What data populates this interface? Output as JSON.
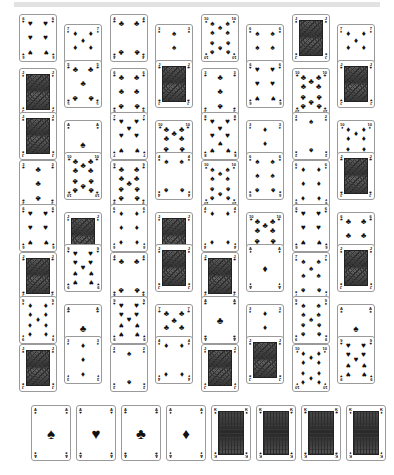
{
  "page": {
    "background_color": "#ffffff",
    "top_bar_color": "#e2e2e2",
    "card_border_color": "#9a9a9a",
    "pip_color": "#111111",
    "width": 394,
    "height": 475
  },
  "suit_glyphs": {
    "spades": "♠",
    "hearts": "♥",
    "clubs": "♣",
    "diamonds": "♦"
  },
  "deck": {
    "layout": "staggered-grid",
    "columns": 8,
    "rows": 8,
    "card_width": 38,
    "card_height": 48,
    "cards": [
      {
        "rank": "6",
        "suit": "hearts",
        "kind": "pip",
        "x": 19,
        "y": 14,
        "col": 0,
        "row": 0
      },
      {
        "rank": "7",
        "suit": "diamonds",
        "kind": "pip",
        "x": 64,
        "y": 24,
        "col": 1,
        "row": 0
      },
      {
        "rank": "4",
        "suit": "clubs",
        "kind": "pip",
        "x": 110,
        "y": 14,
        "col": 2,
        "row": 0
      },
      {
        "rank": "3",
        "suit": "spades",
        "kind": "pip",
        "x": 155,
        "y": 24,
        "col": 3,
        "row": 0
      },
      {
        "rank": "10",
        "suit": "spades",
        "kind": "pip",
        "x": 201,
        "y": 14,
        "col": 4,
        "row": 0
      },
      {
        "rank": "6",
        "suit": "spades",
        "kind": "pip",
        "x": 246,
        "y": 24,
        "col": 5,
        "row": 0
      },
      {
        "rank": "J",
        "suit": "spades",
        "kind": "face",
        "x": 292,
        "y": 14,
        "col": 6,
        "row": 0
      },
      {
        "rank": "7",
        "suit": "diamonds",
        "kind": "pip",
        "x": 337,
        "y": 24,
        "col": 7,
        "row": 0
      },
      {
        "rank": "J",
        "suit": "diamonds",
        "kind": "face",
        "x": 19,
        "y": 68,
        "col": 0,
        "row": 1
      },
      {
        "rank": "5",
        "suit": "clubs",
        "kind": "pip",
        "x": 64,
        "y": 60,
        "col": 1,
        "row": 1
      },
      {
        "rank": "6",
        "suit": "clubs",
        "kind": "pip",
        "x": 110,
        "y": 68,
        "col": 2,
        "row": 1
      },
      {
        "rank": "J",
        "suit": "clubs",
        "kind": "face",
        "x": 155,
        "y": 60,
        "col": 3,
        "row": 1
      },
      {
        "rank": "3",
        "suit": "clubs",
        "kind": "pip",
        "x": 201,
        "y": 68,
        "col": 4,
        "row": 1
      },
      {
        "rank": "6",
        "suit": "hearts",
        "kind": "pip",
        "x": 246,
        "y": 60,
        "col": 5,
        "row": 1
      },
      {
        "rank": "10",
        "suit": "clubs",
        "kind": "pip",
        "x": 292,
        "y": 68,
        "col": 6,
        "row": 1
      },
      {
        "rank": "J",
        "suit": "hearts",
        "kind": "face",
        "x": 337,
        "y": 60,
        "col": 7,
        "row": 1
      },
      {
        "rank": "J",
        "suit": "spades",
        "kind": "face",
        "x": 19,
        "y": 112,
        "col": 0,
        "row": 2
      },
      {
        "rank": "A",
        "suit": "spades",
        "kind": "ace",
        "x": 64,
        "y": 120,
        "col": 1,
        "row": 2
      },
      {
        "rank": "7",
        "suit": "hearts",
        "kind": "pip",
        "x": 110,
        "y": 112,
        "col": 2,
        "row": 2
      },
      {
        "rank": "10",
        "suit": "clubs",
        "kind": "pip",
        "x": 155,
        "y": 120,
        "col": 3,
        "row": 2
      },
      {
        "rank": "8",
        "suit": "hearts",
        "kind": "pip",
        "x": 201,
        "y": 112,
        "col": 4,
        "row": 2
      },
      {
        "rank": "3",
        "suit": "diamonds",
        "kind": "pip",
        "x": 246,
        "y": 120,
        "col": 5,
        "row": 2
      },
      {
        "rank": "2",
        "suit": "spades",
        "kind": "pip",
        "x": 292,
        "y": 112,
        "col": 6,
        "row": 2
      },
      {
        "rank": "10",
        "suit": "diamonds",
        "kind": "pip",
        "x": 337,
        "y": 120,
        "col": 7,
        "row": 2
      },
      {
        "rank": "3",
        "suit": "clubs",
        "kind": "pip",
        "x": 19,
        "y": 160,
        "col": 0,
        "row": 3
      },
      {
        "rank": "10",
        "suit": "clubs",
        "kind": "pip",
        "x": 64,
        "y": 152,
        "col": 1,
        "row": 3
      },
      {
        "rank": "9",
        "suit": "clubs",
        "kind": "pip",
        "x": 110,
        "y": 160,
        "col": 2,
        "row": 3
      },
      {
        "rank": "4",
        "suit": "spades",
        "kind": "pip",
        "x": 155,
        "y": 152,
        "col": 3,
        "row": 3
      },
      {
        "rank": "10",
        "suit": "spades",
        "kind": "pip",
        "x": 201,
        "y": 160,
        "col": 4,
        "row": 3
      },
      {
        "rank": "6",
        "suit": "spades",
        "kind": "pip",
        "x": 246,
        "y": 152,
        "col": 5,
        "row": 3
      },
      {
        "rank": "6",
        "suit": "diamonds",
        "kind": "pip",
        "x": 292,
        "y": 160,
        "col": 6,
        "row": 3
      },
      {
        "rank": "J",
        "suit": "clubs",
        "kind": "face",
        "x": 337,
        "y": 152,
        "col": 7,
        "row": 3
      },
      {
        "rank": "6",
        "suit": "hearts",
        "kind": "pip",
        "x": 19,
        "y": 204,
        "col": 0,
        "row": 4
      },
      {
        "rank": "J",
        "suit": "diamonds",
        "kind": "face",
        "x": 64,
        "y": 212,
        "col": 1,
        "row": 4
      },
      {
        "rank": "6",
        "suit": "diamonds",
        "kind": "pip",
        "x": 110,
        "y": 204,
        "col": 2,
        "row": 4
      },
      {
        "rank": "J",
        "suit": "diamonds",
        "kind": "face",
        "x": 155,
        "y": 212,
        "col": 3,
        "row": 4
      },
      {
        "rank": "4",
        "suit": "diamonds",
        "kind": "pip",
        "x": 201,
        "y": 204,
        "col": 4,
        "row": 4
      },
      {
        "rank": "10",
        "suit": "clubs",
        "kind": "pip",
        "x": 246,
        "y": 212,
        "col": 5,
        "row": 4
      },
      {
        "rank": "6",
        "suit": "hearts",
        "kind": "pip",
        "x": 292,
        "y": 204,
        "col": 6,
        "row": 4
      },
      {
        "rank": "6",
        "suit": "clubs",
        "kind": "pip",
        "x": 337,
        "y": 212,
        "col": 7,
        "row": 4
      },
      {
        "rank": "J",
        "suit": "clubs",
        "kind": "face",
        "x": 19,
        "y": 252,
        "col": 0,
        "row": 5
      },
      {
        "rank": "9",
        "suit": "hearts",
        "kind": "pip",
        "x": 64,
        "y": 244,
        "col": 1,
        "row": 5
      },
      {
        "rank": "4",
        "suit": "clubs",
        "kind": "pip",
        "x": 110,
        "y": 252,
        "col": 2,
        "row": 5
      },
      {
        "rank": "J",
        "suit": "spades",
        "kind": "face",
        "x": 155,
        "y": 244,
        "col": 3,
        "row": 5
      },
      {
        "rank": "J",
        "suit": "clubs",
        "kind": "face",
        "x": 201,
        "y": 252,
        "col": 4,
        "row": 5
      },
      {
        "rank": "A",
        "suit": "diamonds",
        "kind": "ace",
        "x": 246,
        "y": 244,
        "col": 5,
        "row": 5
      },
      {
        "rank": "7",
        "suit": "spades",
        "kind": "pip",
        "x": 292,
        "y": 252,
        "col": 6,
        "row": 5
      },
      {
        "rank": "J",
        "suit": "spades",
        "kind": "face",
        "x": 337,
        "y": 244,
        "col": 7,
        "row": 5
      },
      {
        "rank": "9",
        "suit": "diamonds",
        "kind": "pip",
        "x": 19,
        "y": 296,
        "col": 0,
        "row": 6
      },
      {
        "rank": "A",
        "suit": "clubs",
        "kind": "ace",
        "x": 64,
        "y": 304,
        "col": 1,
        "row": 6
      },
      {
        "rank": "9",
        "suit": "hearts",
        "kind": "pip",
        "x": 110,
        "y": 296,
        "col": 2,
        "row": 6
      },
      {
        "rank": "7",
        "suit": "clubs",
        "kind": "pip",
        "x": 155,
        "y": 304,
        "col": 3,
        "row": 6
      },
      {
        "rank": "A",
        "suit": "clubs",
        "kind": "ace",
        "x": 201,
        "y": 296,
        "col": 4,
        "row": 6
      },
      {
        "rank": "3",
        "suit": "diamonds",
        "kind": "pip",
        "x": 246,
        "y": 304,
        "col": 5,
        "row": 6
      },
      {
        "rank": "9",
        "suit": "spades",
        "kind": "pip",
        "x": 292,
        "y": 296,
        "col": 6,
        "row": 6
      },
      {
        "rank": "A",
        "suit": "spades",
        "kind": "ace",
        "x": 337,
        "y": 304,
        "col": 7,
        "row": 6
      },
      {
        "rank": "J",
        "suit": "spades",
        "kind": "face",
        "x": 19,
        "y": 344,
        "col": 0,
        "row": 7
      },
      {
        "rank": "3",
        "suit": "diamonds",
        "kind": "pip",
        "x": 64,
        "y": 336,
        "col": 1,
        "row": 7
      },
      {
        "rank": "2",
        "suit": "spades",
        "kind": "pip",
        "x": 110,
        "y": 344,
        "col": 2,
        "row": 7
      },
      {
        "rank": "4",
        "suit": "diamonds",
        "kind": "pip",
        "x": 155,
        "y": 336,
        "col": 3,
        "row": 7
      },
      {
        "rank": "J",
        "suit": "diamonds",
        "kind": "face",
        "x": 201,
        "y": 344,
        "col": 4,
        "row": 7
      },
      {
        "rank": "J",
        "suit": "spades",
        "kind": "face",
        "x": 246,
        "y": 336,
        "col": 5,
        "row": 7
      },
      {
        "rank": "10",
        "suit": "diamonds",
        "kind": "pip",
        "x": 292,
        "y": 344,
        "col": 6,
        "row": 7
      },
      {
        "rank": "9",
        "suit": "hearts",
        "kind": "pip",
        "x": 337,
        "y": 336,
        "col": 7,
        "row": 7
      }
    ]
  },
  "bottom_row": {
    "label": "aces-and-kings",
    "card_width": 40,
    "card_height": 56,
    "cards": [
      {
        "rank": "A",
        "suit": "spades",
        "kind": "ace",
        "x": 31,
        "y": 405
      },
      {
        "rank": "A",
        "suit": "hearts",
        "kind": "ace",
        "x": 76,
        "y": 405
      },
      {
        "rank": "A",
        "suit": "clubs",
        "kind": "ace",
        "x": 121,
        "y": 405
      },
      {
        "rank": "A",
        "suit": "diamonds",
        "kind": "ace",
        "x": 166,
        "y": 405
      },
      {
        "rank": "K",
        "suit": "spades",
        "kind": "face",
        "x": 211,
        "y": 405
      },
      {
        "rank": "K",
        "suit": "hearts",
        "kind": "face",
        "x": 256,
        "y": 405
      },
      {
        "rank": "K",
        "suit": "clubs",
        "kind": "face",
        "x": 301,
        "y": 405
      },
      {
        "rank": "K",
        "suit": "diamonds",
        "kind": "face",
        "x": 346,
        "y": 405
      }
    ]
  }
}
